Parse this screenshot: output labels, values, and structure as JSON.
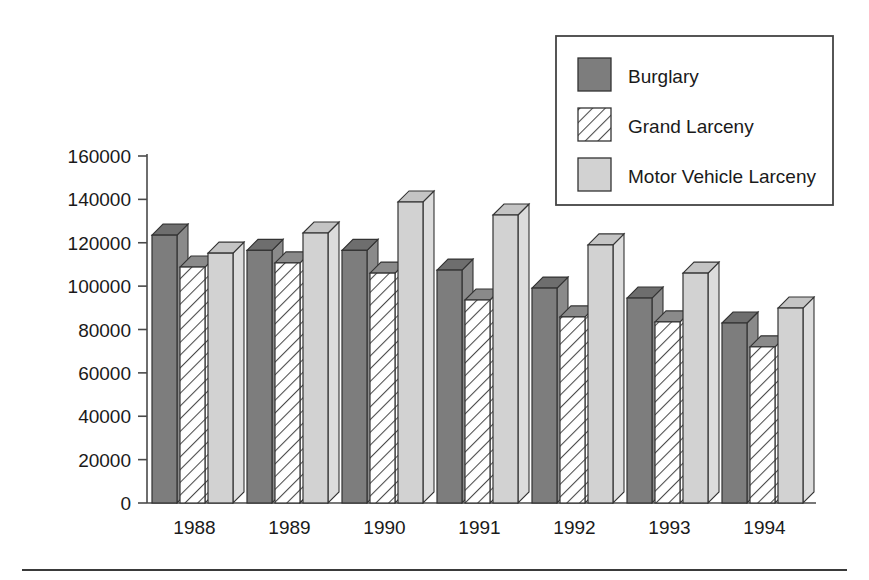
{
  "chart_data": {
    "type": "bar",
    "title": "",
    "subtitle": "",
    "xlabel": "",
    "ylabel": "",
    "categories": [
      "1988",
      "1989",
      "1990",
      "1991",
      "1992",
      "1993",
      "1994"
    ],
    "series": [
      {
        "name": "Burglary",
        "values": [
          123500,
          116500,
          116500,
          107400,
          99100,
          94500,
          83000
        ]
      },
      {
        "name": "Grand Larceny",
        "values": [
          108800,
          110700,
          106000,
          93600,
          85800,
          83500,
          72000
        ]
      },
      {
        "name": "Motor Vehicle Larceny",
        "values": [
          115200,
          124500,
          138800,
          132800,
          119000,
          106000,
          89900
        ]
      }
    ],
    "ylim": [
      0,
      160000
    ],
    "ytick_labels": [
      "0",
      "20000",
      "40000",
      "60000",
      "80000",
      "100000",
      "120000",
      "140000",
      "160000"
    ],
    "ytick_values": [
      0,
      20000,
      40000,
      60000,
      80000,
      100000,
      120000,
      140000,
      160000
    ],
    "grid": false,
    "legend_position": "top-right",
    "style": "3d-bars",
    "colors": {
      "burglary_fill": "#7d7d7d",
      "burglary_top": "#6e6e6e",
      "burglary_side": "#8a8a8a",
      "grand_larceny_fill": "#ffffff",
      "grand_larceny_hatch": "#4a4a4a",
      "grand_larceny_top": "#8a8a8a",
      "motor_vehicle_fill": "#d2d2d2",
      "motor_vehicle_top": "#c4c4c4",
      "motor_vehicle_side": "#dcdcdc",
      "outline": "#333333",
      "axis": "#4a4a4a",
      "legend_border": "#444444",
      "footer_rule": "#3a3a3a"
    }
  },
  "legend": {
    "items": [
      {
        "label": "Burglary",
        "swatch": "solid-dark-swatch"
      },
      {
        "label": "Grand Larceny",
        "swatch": "hatched-swatch"
      },
      {
        "label": "Motor Vehicle Larceny",
        "swatch": "solid-light-swatch"
      }
    ]
  },
  "axes": {
    "y_ticks": [
      "160000",
      "140000",
      "120000",
      "100000",
      "80000",
      "60000",
      "40000",
      "20000",
      "0"
    ],
    "x_ticks": [
      "1988",
      "1989",
      "1990",
      "1991",
      "1992",
      "1993",
      "1994"
    ]
  },
  "footer": {
    "rule": "horizontal-rule"
  }
}
